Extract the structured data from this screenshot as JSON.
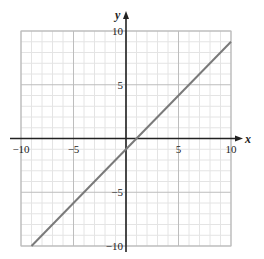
{
  "chart_data": {
    "type": "line",
    "title": "",
    "xlabel": "x",
    "ylabel": "y",
    "xlim": [
      -10,
      10
    ],
    "ylim": [
      -10,
      10
    ],
    "grid": true,
    "grid_minor_step": 1,
    "grid_major_step": 5,
    "x_ticks": [
      -10,
      -5,
      5,
      10
    ],
    "y_ticks": [
      10,
      5,
      -5,
      -10
    ],
    "x_tick_labels": [
      "−10",
      "−5",
      "5",
      "10"
    ],
    "y_tick_labels": [
      "10",
      "5",
      "−5",
      "−10"
    ],
    "series": [
      {
        "name": "y = x − 1",
        "equation": "y = x - 1",
        "slope": 1,
        "intercept": -1,
        "x": [
          -9,
          10
        ],
        "y": [
          -10,
          9
        ],
        "color": "#7a7a7a"
      }
    ]
  },
  "colors": {
    "minor_grid": "#e4e4e4",
    "major_grid": "#bdbdbd",
    "axis": "#222222",
    "line": "#7a7a7a"
  }
}
